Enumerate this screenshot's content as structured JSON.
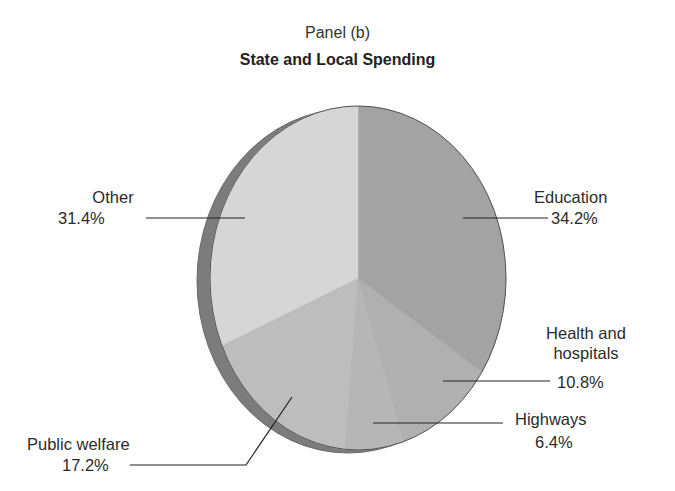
{
  "panel_label": "Panel (b)",
  "title": "State and Local Spending",
  "labels": {
    "education": {
      "name": "Education",
      "value": "34.2%"
    },
    "health": {
      "name_line1": "Health and",
      "name_line2": "hospitals",
      "value": "10.8%"
    },
    "highways": {
      "name": "Highways",
      "value": "6.4%"
    },
    "public_welfare": {
      "name": "Public welfare",
      "value": "17.2%"
    },
    "other": {
      "name": "Other",
      "value": "31.4%"
    }
  },
  "colors": {
    "education": "#a3a3a3",
    "health": "#b0b0b0",
    "highways": "#b6b6b6",
    "public_welfare": "#bdbdbd",
    "other": "#d6d6d6",
    "edge": "#7c7c7c",
    "outline": "#555555",
    "leader": "#222222"
  },
  "chart_data": {
    "type": "pie",
    "title": "State and Local Spending",
    "subtitle": "Panel (b)",
    "categories": [
      "Education",
      "Health and hospitals",
      "Highways",
      "Public welfare",
      "Other"
    ],
    "values": [
      34.2,
      10.8,
      6.4,
      17.2,
      31.4
    ],
    "unit": "%",
    "start_angle": "12 o'clock, clockwise",
    "style": "3D tilted pie, grayscale",
    "legend": "none (direct labels with leader lines)"
  }
}
